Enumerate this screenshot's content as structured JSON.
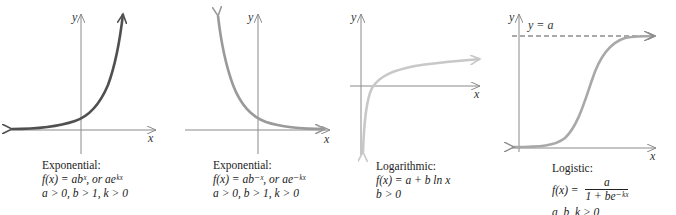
{
  "panels": [
    {
      "type": "Exponential growth",
      "title": "Exponential:",
      "formula": "f(x) = ab^x, or ae^{kx}",
      "formula_display": "f(x) = abˣ, or aeᵏˣ",
      "conditions": "a > 0, b > 1, k > 0",
      "axis_x": "x",
      "axis_y": "y",
      "curve_color": "#505050"
    },
    {
      "type": "Exponential decay",
      "title": "Exponential:",
      "formula": "f(x) = ab^{-x}, or ae^{-kx}",
      "formula_display": "f(x) = ab⁻ˣ, or ae⁻ᵏˣ",
      "conditions": "a > 0, b > 1, k > 0",
      "axis_x": "x",
      "axis_y": "y",
      "curve_color": "#9a9a9a"
    },
    {
      "type": "Logarithmic",
      "title": "Logarithmic:",
      "formula": "f(x) = a + b ln x",
      "formula_display": "f(x) = a + b  ln x",
      "conditions": "b > 0",
      "axis_x": "x",
      "axis_y": "y",
      "curve_color": "#c8c8c8"
    },
    {
      "type": "Logistic",
      "title": "Logistic:",
      "formula_lhs": "f(x) =",
      "numerator": "a",
      "denominator": "1 + be⁻ᵏˣ",
      "formula": "f(x) = a / (1 + be^{-kx})",
      "conditions": "a, b, k > 0",
      "asymptote_label": "y = a",
      "axis_x": "x",
      "axis_y": "y",
      "curve_color": "#a8a8a8"
    }
  ],
  "colors": {
    "axis": "#8a8a8a",
    "text": "#222222"
  }
}
